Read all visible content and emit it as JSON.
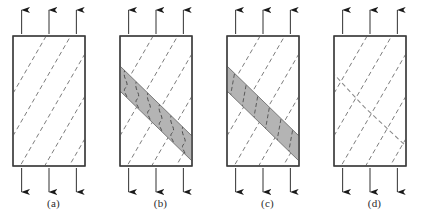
{
  "figure": {
    "background_color": "#ffffff",
    "panel_count": 4
  },
  "style": {
    "specimen_outline_color": "#3a3a3a",
    "specimen_fill_color": "#ffffff",
    "layer_line_color": "#7d7d7d",
    "band_fill_color": "#b4b4b4",
    "band_outline_color": "#6e6e6e",
    "arrow_color": "#1a1a1a",
    "crack_line_color": "#8a8a8a",
    "label_color": "#2b2b2b"
  },
  "geometry": {
    "box": {
      "x": 13,
      "y": 36,
      "width": 72,
      "height": 130
    },
    "layer_angle_deg": 60,
    "layer_count": 5,
    "arrow_positions_pct": [
      12,
      50,
      88
    ],
    "arrow_count_top": 3,
    "arrow_count_bottom": 3,
    "top_arrow_direction": "up",
    "bottom_arrow_direction": "down",
    "band_top_left_y": 66,
    "band_thickness_px": 25
  },
  "panels": [
    {
      "id": "panel-a",
      "label": "(a)",
      "x_offset": 0,
      "state": "intact-layered-specimen",
      "has_shear_band": false,
      "band_internal_lines": "none",
      "has_crack": false,
      "description": "Undeformed specimen with inclined dashed layers under axial tension"
    },
    {
      "id": "panel-b",
      "label": "(b)",
      "x_offset": 107,
      "state": "shear-band-with-buckled-layers",
      "has_shear_band": true,
      "band_internal_lines": "wavy",
      "has_crack": false,
      "description": "Shaded shear band forms; layers inside the band buckle into wavy kinks"
    },
    {
      "id": "panel-c",
      "label": "(c)",
      "x_offset": 214,
      "state": "shear-band-with-rotated-straight-layers",
      "has_shear_band": true,
      "band_internal_lines": "straight",
      "has_crack": false,
      "description": "Shaded shear band with layers rotated to straight segments across the band"
    },
    {
      "id": "panel-d",
      "label": "(d)",
      "x_offset": 321,
      "state": "through-going-shear-fracture",
      "has_shear_band": false,
      "band_internal_lines": "none",
      "has_crack": true,
      "description": "Band localises into a single through-going shear fracture; shading removed"
    }
  ]
}
